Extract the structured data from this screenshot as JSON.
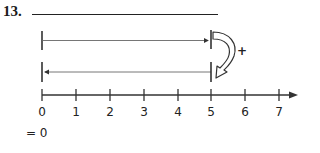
{
  "question": {
    "number": "13.",
    "answer_blank": ""
  },
  "operation": {
    "sign": "+",
    "result_text": "= 0"
  },
  "segments": [
    {
      "id": "upper",
      "from": 0,
      "to": 5,
      "direction": "right"
    },
    {
      "id": "lower",
      "from": 5,
      "to": 0,
      "direction": "left"
    }
  ],
  "number_line": {
    "ticks": [
      "0",
      "1",
      "2",
      "3",
      "4",
      "5",
      "6",
      "7"
    ],
    "arrow": "right"
  },
  "colors": {
    "ink": "#222222",
    "segment_line": "#555555",
    "background": "#ffffff"
  }
}
